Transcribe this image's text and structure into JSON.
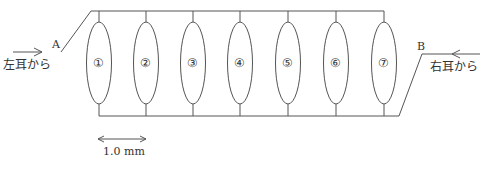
{
  "diagram": {
    "stroke_color": "#555555",
    "labels": {
      "left_input": "左耳から",
      "right_input": "右耳から",
      "point_a": "A",
      "point_b": "B",
      "scale": "1.0 mm"
    },
    "elements": [
      {
        "id": 1,
        "label": "①",
        "x": 99
      },
      {
        "id": 2,
        "label": "②",
        "x": 146
      },
      {
        "id": 3,
        "label": "③",
        "x": 193
      },
      {
        "id": 4,
        "label": "④",
        "x": 240
      },
      {
        "id": 5,
        "label": "⑤",
        "x": 288
      },
      {
        "id": 6,
        "label": "⑥",
        "x": 336
      },
      {
        "id": 7,
        "label": "⑦",
        "x": 384
      }
    ]
  }
}
